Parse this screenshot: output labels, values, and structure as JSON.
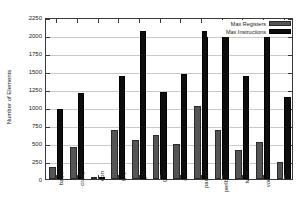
{
  "chart_data": {
    "type": "bar",
    "title": "",
    "xlabel": "",
    "ylabel": "Number of Elements",
    "ylim": [
      0,
      2250
    ],
    "yticks": [
      0,
      250,
      500,
      750,
      1000,
      1250,
      1500,
      1750,
      2000,
      2250
    ],
    "grid": true,
    "legend_position": "top-right",
    "categories": [
      "bzip2",
      "crafty",
      "eon",
      "gap",
      "gcc",
      "gzip",
      "mcf",
      "parser",
      "perlbmk",
      "twolf",
      "vortex",
      "vpr"
    ],
    "series": [
      {
        "name": "Max Registers",
        "color": "#555555",
        "values": [
          170,
          445,
          5,
          675,
          545,
          605,
          485,
          1015,
          685,
          405,
          510,
          240
        ]
      },
      {
        "name": "Max Instructions",
        "color": "#0d0d0d",
        "values": [
          975,
          1195,
          25,
          1430,
          2050,
          1205,
          1460,
          2050,
          2050,
          1425,
          2050,
          1135
        ]
      }
    ]
  },
  "legend": {
    "entries": [
      {
        "label": "Max Registers"
      },
      {
        "label": "Max Instructions"
      }
    ]
  },
  "axes": {
    "y_title": "Number of Elements",
    "y_tick_labels": [
      "2250",
      "2000",
      "1750",
      "1500",
      "1250",
      "1000",
      "750",
      "500",
      "250",
      "0"
    ]
  }
}
